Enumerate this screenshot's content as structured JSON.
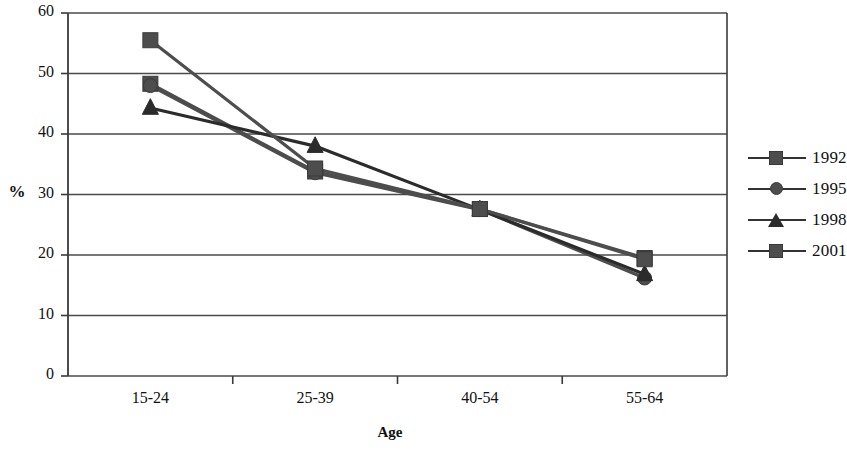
{
  "chart_data": {
    "type": "line",
    "title": "",
    "xlabel": "Age",
    "ylabel": "%",
    "categories": [
      "15-24",
      "25-39",
      "40-54",
      "55-64"
    ],
    "ylim": [
      0,
      60
    ],
    "ytick_labels": [
      "0",
      "10",
      "20",
      "30",
      "40",
      "50",
      "60"
    ],
    "ytick_values": [
      0,
      10,
      20,
      30,
      40,
      50,
      60
    ],
    "grid": true,
    "legend_position": "right",
    "series": [
      {
        "name": "1992",
        "marker": "square",
        "color": "#4d4d4d",
        "values": [
          48.3,
          33.8,
          27.6,
          19.5
        ]
      },
      {
        "name": "1995",
        "marker": "circle",
        "color": "#4d4d4d",
        "values": [
          48.0,
          33.6,
          27.5,
          16.2
        ]
      },
      {
        "name": "1998",
        "marker": "triangle",
        "color": "#2b2b2b",
        "values": [
          44.3,
          38.0,
          27.5,
          16.8
        ]
      },
      {
        "name": "2001",
        "marker": "square",
        "color": "#4d4d4d",
        "values": [
          55.5,
          34.3,
          27.6,
          19.3
        ]
      }
    ]
  },
  "legend": {
    "items": [
      {
        "label": "1992",
        "marker": "square"
      },
      {
        "label": "1995",
        "marker": "circle"
      },
      {
        "label": "1998",
        "marker": "triangle"
      },
      {
        "label": "2001",
        "marker": "square"
      }
    ]
  },
  "axes": {
    "y_title": "%",
    "x_title": "Age"
  },
  "colors": {
    "series_gray": "#4d4d4d",
    "series_dark": "#2b2b2b",
    "grid": "#4a4a4a",
    "frame": "#3a3a3a",
    "background": "#ffffff"
  }
}
